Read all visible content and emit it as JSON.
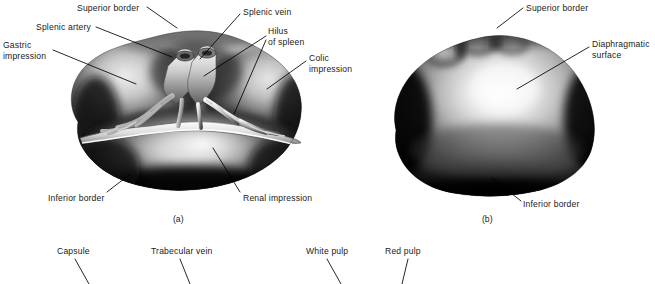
{
  "figure": {
    "background": "#ffffff",
    "text_color": "#1a1a1a",
    "leader_color": "#000000"
  },
  "panels": [
    {
      "id": "a",
      "caption": "(a)",
      "caption_x": 173,
      "caption_y": 214,
      "description": "Visceral surface of spleen"
    },
    {
      "id": "b",
      "caption": "(b)",
      "caption_x": 482,
      "caption_y": 214,
      "description": "Diaphragmatic surface of spleen"
    }
  ],
  "labels_panel_a": [
    {
      "name": "superior-border",
      "text": "Superior border",
      "x": 77,
      "y": 3,
      "align": "left"
    },
    {
      "name": "splenic-artery",
      "text": "Splenic artery",
      "x": 36,
      "y": 24,
      "align": "left"
    },
    {
      "name": "gastric-impression",
      "text": "Gastric\nimpression",
      "x": 3,
      "y": 41,
      "align": "left"
    },
    {
      "name": "splenic-vein",
      "text": "Splenic vein",
      "x": 243,
      "y": 8,
      "align": "left"
    },
    {
      "name": "hilus-of-spleen",
      "text": "Hilus\nof spleen",
      "x": 268,
      "y": 27,
      "align": "left"
    },
    {
      "name": "colic-impression",
      "text": "Colic\nimpression",
      "x": 309,
      "y": 54,
      "align": "left"
    },
    {
      "name": "inferior-border",
      "text": "Inferior border",
      "x": 48,
      "y": 194,
      "align": "left"
    },
    {
      "name": "renal-impression",
      "text": "Renal impression",
      "x": 243,
      "y": 194,
      "align": "left"
    }
  ],
  "labels_panel_b": [
    {
      "name": "superior-border",
      "text": "Superior border",
      "x": 526,
      "y": 3,
      "align": "left"
    },
    {
      "name": "diaphragmatic-surface",
      "text": "Diaphragmatic\nsurface",
      "x": 592,
      "y": 40,
      "align": "left"
    },
    {
      "name": "inferior-border",
      "text": "Inferior border",
      "x": 523,
      "y": 200,
      "align": "left"
    }
  ],
  "labels_panel_c": [
    {
      "name": "capsule",
      "text": "Capsule",
      "x": 57,
      "y": 247,
      "align": "left"
    },
    {
      "name": "trabecular-vein",
      "text": "Trabecular vein",
      "x": 151,
      "y": 247,
      "align": "left"
    },
    {
      "name": "white-pulp",
      "text": "White pulp",
      "x": 306,
      "y": 247,
      "align": "left"
    },
    {
      "name": "red-pulp",
      "text": "Red pulp",
      "x": 385,
      "y": 247,
      "align": "left"
    }
  ],
  "leader_lines": [
    {
      "name": "leader-superior-border-a",
      "points": "147,7 177,28"
    },
    {
      "name": "leader-splenic-artery-a",
      "points": "96,27 170,56"
    },
    {
      "name": "leader-gastric-impression-a",
      "points": "53,50 135,84"
    },
    {
      "name": "leader-splenic-vein-a",
      "points": "240,14 199,58"
    },
    {
      "name": "leader-hilus-1",
      "points": "266,36 205,75"
    },
    {
      "name": "leader-hilus-2",
      "points": "266,40 234,113"
    },
    {
      "name": "leader-colic-impression",
      "points": "306,60 268,88"
    },
    {
      "name": "leader-inferior-border-a",
      "points": "107,193 128,176"
    },
    {
      "name": "leader-renal-impression",
      "points": "240,193 213,149"
    },
    {
      "name": "leader-superior-border-b",
      "points": "523,8 497,28"
    },
    {
      "name": "leader-diaphragmatic-surface",
      "points": "589,46 517,88"
    },
    {
      "name": "leader-inferior-border-b",
      "points": "521,202 492,178"
    },
    {
      "name": "leader-capsule",
      "points": "75,258 89,281"
    },
    {
      "name": "leader-trabecular-vein",
      "points": "180,258 190,281"
    },
    {
      "name": "leader-white-pulp",
      "points": "327,258 341,281"
    },
    {
      "name": "leader-red-pulp",
      "points": "408,258 402,281"
    }
  ]
}
